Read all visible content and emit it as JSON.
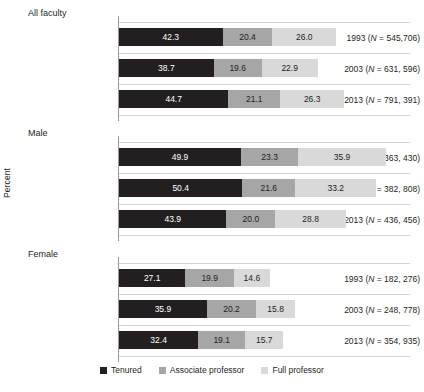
{
  "chart_data": {
    "type": "bar",
    "orientation": "horizontal",
    "stacked": false,
    "title": "",
    "xlabel": "",
    "ylabel": "Percent",
    "grid": true,
    "legend_position": "bottom",
    "xlim": [
      0,
      120
    ],
    "series": [
      {
        "name": "Tenured",
        "color": "#231f20"
      },
      {
        "name": "Associate professor",
        "color": "#a6a6a6"
      },
      {
        "name": "Full professor",
        "color": "#d9d9d9"
      }
    ],
    "groups": [
      {
        "label": "All faculty",
        "rows": [
          {
            "year": "1993",
            "n": "545,706",
            "values": [
              42.3,
              20.4,
              26.0
            ]
          },
          {
            "year": "2003",
            "n": "631, 596",
            "values": [
              38.7,
              19.6,
              22.9
            ]
          },
          {
            "year": "2013",
            "n": "791, 391",
            "values": [
              44.7,
              21.1,
              26.3
            ]
          }
        ]
      },
      {
        "label": "Male",
        "rows": [
          {
            "year": "1993",
            "n": "363, 430",
            "values": [
              49.9,
              23.3,
              35.9
            ]
          },
          {
            "year": "2003",
            "n": "382, 808",
            "values": [
              50.4,
              21.6,
              33.2
            ]
          },
          {
            "year": "2013",
            "n": "436, 456",
            "values": [
              43.9,
              20.0,
              28.8
            ]
          }
        ]
      },
      {
        "label": "Female",
        "rows": [
          {
            "year": "1993",
            "n": "182, 276",
            "values": [
              27.1,
              19.9,
              14.6
            ]
          },
          {
            "year": "2003",
            "n": "248, 778",
            "values": [
              35.9,
              20.2,
              15.8
            ]
          },
          {
            "year": "2013",
            "n": "354, 935",
            "values": [
              32.4,
              19.1,
              15.7
            ]
          }
        ]
      }
    ]
  },
  "axis": {
    "y_title": "Percent"
  },
  "legend": {
    "items": [
      {
        "label": "Tenured",
        "color": "#231f20"
      },
      {
        "label": "Associate professor",
        "color": "#a6a6a6"
      },
      {
        "label": "Full professor",
        "color": "#d9d9d9"
      }
    ]
  }
}
